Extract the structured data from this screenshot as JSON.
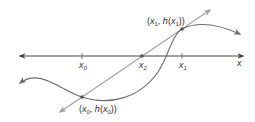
{
  "diagram": {
    "axis_label": "x",
    "ticks": [
      {
        "name": "x0",
        "base": "x",
        "sub": "0",
        "x": 82
      },
      {
        "name": "x2",
        "base": "x",
        "sub": "2",
        "x": 142
      },
      {
        "name": "x1",
        "base": "x",
        "sub": "1",
        "x": 182
      }
    ],
    "points": {
      "p0": {
        "open": "(",
        "x": "x",
        "xsub": "0",
        "sep": ", ",
        "f": "h",
        "fopen": "(",
        "fx": "x",
        "fxsub": "0",
        "close": "))"
      },
      "p1": {
        "open": "(",
        "x": "x",
        "xsub": "1",
        "sep": ", ",
        "f": "h",
        "fopen": "(",
        "fx": "x",
        "fxsub": "1",
        "close": "))"
      }
    },
    "colors": {
      "axis": "#444444",
      "curve": "#6e6e6e",
      "secant": "#9a9a9a",
      "point": "#555555",
      "text": "#333333"
    }
  }
}
